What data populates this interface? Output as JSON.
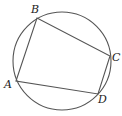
{
  "diagram": {
    "type": "cyclic-quadrilateral",
    "circle": {
      "cx": 62,
      "cy": 61,
      "r": 49
    },
    "points": [
      {
        "name": "A",
        "x": 16,
        "y": 81,
        "label_x": 4,
        "label_y": 88
      },
      {
        "name": "B",
        "x": 37,
        "y": 18,
        "label_x": 31,
        "label_y": 13
      },
      {
        "name": "C",
        "x": 110,
        "y": 56,
        "label_x": 112,
        "label_y": 61
      },
      {
        "name": "D",
        "x": 98,
        "y": 94,
        "label_x": 98,
        "label_y": 103
      }
    ],
    "edges": [
      [
        "A",
        "B"
      ],
      [
        "B",
        "C"
      ],
      [
        "C",
        "D"
      ],
      [
        "D",
        "A"
      ]
    ]
  }
}
